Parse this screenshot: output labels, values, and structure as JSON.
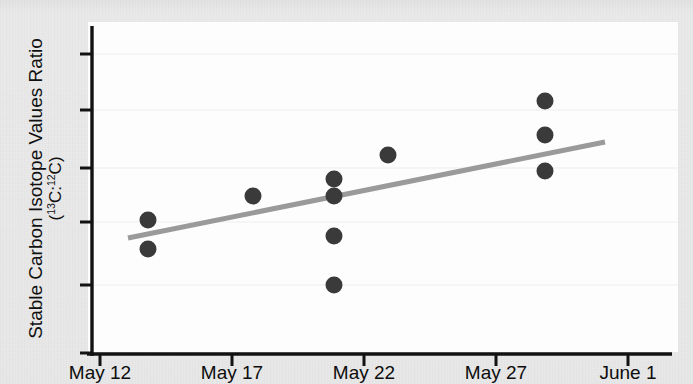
{
  "figure": {
    "background_color": "#e8e8e8",
    "plot_background_color": "#fdfdfd",
    "axis_color": "#101010",
    "point_color": "#3a3a3a",
    "trendline_color": "#9a9a9a",
    "gridline_color": "#ececec"
  },
  "axis": {
    "ylabel_line1": "Stable Carbon Isotope Values Ratio",
    "ylabel_line2_pre": "(",
    "ylabel_line2_a_sup": "13",
    "ylabel_line2_a": "C:",
    "ylabel_line2_b_sup": "12",
    "ylabel_line2_b": "C)",
    "xlabel": ""
  },
  "chart_data": {
    "type": "scatter",
    "title": "",
    "xlabel": "",
    "ylabel": "Stable Carbon Isotope Values Ratio (13C:12C)",
    "x_tick_labels": [
      "May 12",
      "May 17",
      "May 22",
      "May 27",
      "June 1"
    ],
    "x_tick_pixels": [
      100,
      232,
      364,
      496,
      628
    ],
    "y_tick_labels": [],
    "y_tick_pixels": [
      54,
      110,
      168,
      222,
      285,
      353
    ],
    "grid": "horizontal-faint",
    "legend": "none",
    "xlim_dates": [
      "May 12",
      "June 1"
    ],
    "points_pixels": [
      {
        "x": 148,
        "y": 220
      },
      {
        "x": 148,
        "y": 249
      },
      {
        "x": 253,
        "y": 196
      },
      {
        "x": 334,
        "y": 179
      },
      {
        "x": 334,
        "y": 196
      },
      {
        "x": 334,
        "y": 236
      },
      {
        "x": 334,
        "y": 285
      },
      {
        "x": 388,
        "y": 155
      },
      {
        "x": 545,
        "y": 101
      },
      {
        "x": 545,
        "y": 135
      },
      {
        "x": 545,
        "y": 171
      }
    ],
    "points_dates": [
      {
        "date": "May 13.8",
        "series": "sample"
      },
      {
        "date": "May 13.8",
        "series": "sample"
      },
      {
        "date": "May 17.8",
        "series": "sample"
      },
      {
        "date": "May 20.9",
        "series": "sample"
      },
      {
        "date": "May 20.9",
        "series": "sample"
      },
      {
        "date": "May 20.9",
        "series": "sample"
      },
      {
        "date": "May 20.9",
        "series": "sample"
      },
      {
        "date": "May 22.9",
        "series": "sample"
      },
      {
        "date": "May 28.9",
        "series": "sample"
      },
      {
        "date": "May 28.9",
        "series": "sample"
      },
      {
        "date": "May 28.9",
        "series": "sample"
      }
    ],
    "trendline": {
      "x1": 128,
      "y1": 238,
      "x2": 605,
      "y2": 142,
      "style": "solid",
      "width": 5
    },
    "n_points": 11
  }
}
